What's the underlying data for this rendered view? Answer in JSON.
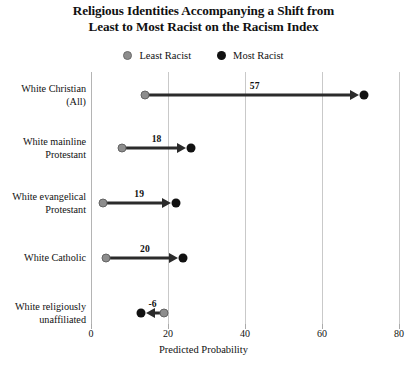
{
  "chart_data": {
    "type": "dumbbell",
    "title": "Religious Identities Accompanying a Shift from Least to Most Racist on the Racism Index",
    "title_lines": [
      "Religious Identities Accompanying a Shift from",
      "Least to Most Racist on the Racism Index"
    ],
    "xlabel": "Predicted Probability",
    "ylabel": "",
    "xlim": [
      0,
      80
    ],
    "xticks": [
      0,
      20,
      40,
      60,
      80
    ],
    "xtick_labels": [
      "0",
      "20",
      "40",
      "60",
      "80"
    ],
    "grid": "vertical",
    "legend_position": "top-center",
    "legend": [
      {
        "name": "Least Racist",
        "color": "#8d8d8d",
        "marker": "circle-gray"
      },
      {
        "name": "Most Racist",
        "color": "#111111",
        "marker": "circle-black"
      }
    ],
    "categories": [
      "White Christian (All)",
      "White mainline Protestant",
      "White evangelical Protestant",
      "White Catholic",
      "White religiously unaffiliated"
    ],
    "series": [
      {
        "name": "Least Racist",
        "color": "#8d8d8d",
        "values": [
          14,
          8,
          3,
          4,
          19
        ]
      },
      {
        "name": "Most Racist",
        "color": "#111111",
        "values": [
          71,
          26,
          22,
          24,
          13
        ]
      }
    ],
    "changes": [
      57,
      18,
      19,
      20,
      -6
    ],
    "change_labels": [
      "57",
      "18",
      "19",
      "20",
      "-6"
    ],
    "rows": [
      {
        "label_lines": [
          "White Christian",
          "(All)"
        ],
        "least": 14,
        "most": 71,
        "change_label": "57",
        "direction": "right"
      },
      {
        "label_lines": [
          "White mainline",
          "Protestant"
        ],
        "least": 8,
        "most": 26,
        "change_label": "18",
        "direction": "right"
      },
      {
        "label_lines": [
          "White evangelical",
          "Protestant"
        ],
        "least": 3,
        "most": 22,
        "change_label": "19",
        "direction": "right"
      },
      {
        "label_lines": [
          "White Catholic"
        ],
        "least": 4,
        "most": 24,
        "change_label": "20",
        "direction": "right"
      },
      {
        "label_lines": [
          "White religiously",
          "unaffiliated"
        ],
        "least": 19,
        "most": 13,
        "change_label": "-6",
        "direction": "left"
      }
    ],
    "colors": {
      "least_racist": "#8d8d8d",
      "most_racist": "#111111",
      "arrow": "#2b2b2b",
      "gridline": "#c9c9c9",
      "background": "#ffffff"
    }
  }
}
